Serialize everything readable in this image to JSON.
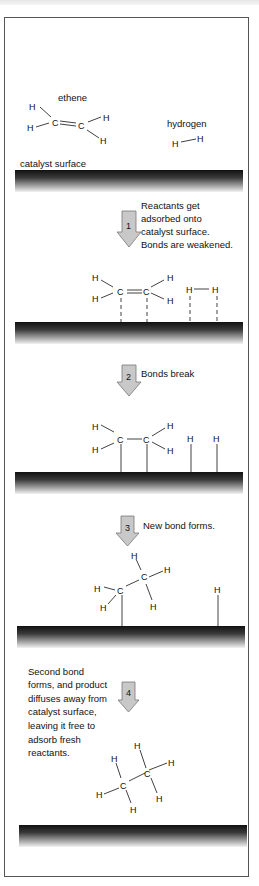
{
  "diagram": {
    "labels": {
      "ethene": "ethene",
      "hydrogen": "hydrogen",
      "catalyst_surface": "catalyst surface"
    },
    "steps": [
      {
        "number": "1",
        "text": [
          "Reactants get",
          "adsorbed onto",
          "catalyst surface.",
          "Bonds are weakened."
        ]
      },
      {
        "number": "2",
        "text": [
          "Bonds break"
        ]
      },
      {
        "number": "3",
        "text": [
          "New bond forms."
        ]
      },
      {
        "number": "4",
        "text": [
          "Second bond",
          "forms, and product",
          "diffuses away from",
          "catalyst surface,",
          "leaving it free to",
          "adsorb fresh",
          "reactants."
        ]
      }
    ],
    "atoms": {
      "H": "H",
      "C": "C"
    },
    "colors": {
      "surface_dark": "#111111",
      "surface_light": "#f4f4f4",
      "arrow_fill": "#c8c8c8",
      "arrow_stroke": "#777777",
      "border": "#555555"
    }
  }
}
